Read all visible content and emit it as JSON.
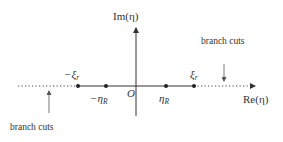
{
  "diagram": {
    "axes": {
      "imaginary_label": "Im(η)",
      "real_label": "Re(η)",
      "origin_label": "O"
    },
    "points": [
      {
        "id": "neg-xi-r",
        "label_main": "−ξ",
        "label_sub": "r",
        "x": 78
      },
      {
        "id": "neg-eta-R",
        "label_main": "−η",
        "label_sub": "R",
        "x": 106
      },
      {
        "id": "eta-R",
        "label_main": "η",
        "label_sub": "R",
        "x": 166
      },
      {
        "id": "xi-r",
        "label_main": "ξ",
        "label_sub": "r",
        "x": 194
      }
    ],
    "annotations": {
      "branch_cuts_right": "branch cuts",
      "branch_cuts_left": "branch cuts"
    },
    "colors": {
      "axis": "#333333",
      "dot": "#222222",
      "text": "#333333",
      "cut": "#444444"
    }
  }
}
